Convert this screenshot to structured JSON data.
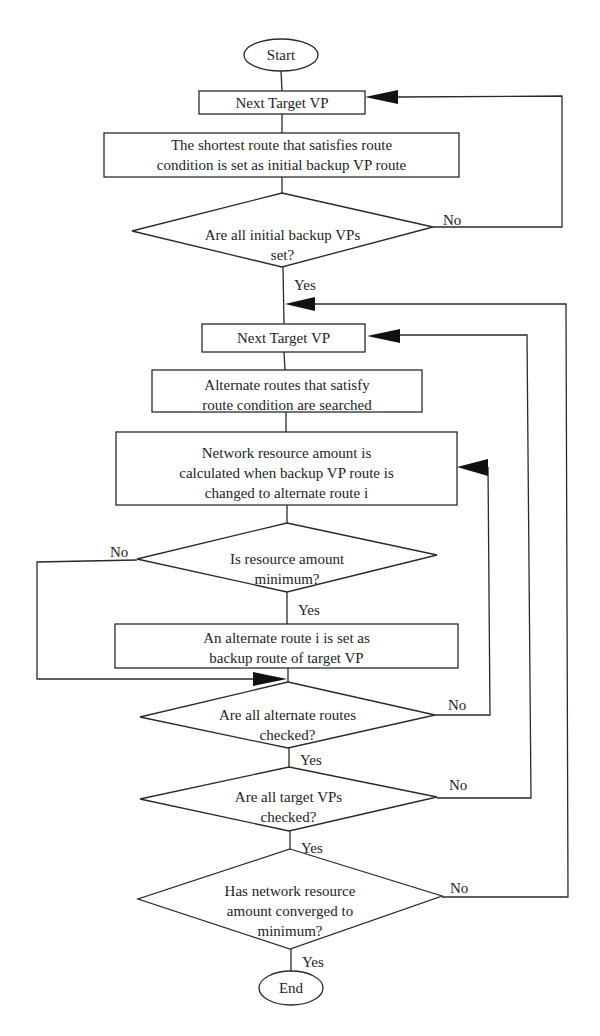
{
  "diagram": {
    "type": "flowchart",
    "nodes": [
      {
        "id": "start",
        "shape": "ellipse",
        "lines": [
          "Start"
        ]
      },
      {
        "id": "next-target-vp-1",
        "shape": "process",
        "lines": [
          "Next Target VP"
        ]
      },
      {
        "id": "set-initial-backup",
        "shape": "process",
        "lines": [
          "The shortest route that satisfies route",
          "condition is set as initial backup VP route"
        ]
      },
      {
        "id": "all-initial-set",
        "shape": "decision",
        "lines": [
          "Are all initial backup VPs",
          "set?"
        ]
      },
      {
        "id": "next-target-vp-2",
        "shape": "process",
        "lines": [
          "Next Target VP"
        ]
      },
      {
        "id": "search-alternate",
        "shape": "process",
        "lines": [
          "Alternate routes that satisfy",
          "route condition are searched"
        ]
      },
      {
        "id": "calc-resource",
        "shape": "process",
        "lines": [
          "Network resource amount is",
          "calculated when backup VP route is",
          "changed to alternate route i"
        ]
      },
      {
        "id": "is-minimum",
        "shape": "decision",
        "lines": [
          "Is resource amount",
          "minimum?"
        ]
      },
      {
        "id": "set-alternate",
        "shape": "process",
        "lines": [
          "An alternate route i is set as",
          "backup route of target VP"
        ]
      },
      {
        "id": "all-alternate-checked",
        "shape": "decision",
        "lines": [
          "Are all alternate routes",
          "checked?"
        ]
      },
      {
        "id": "all-target-checked",
        "shape": "decision",
        "lines": [
          "Are all target VPs",
          "checked?"
        ]
      },
      {
        "id": "converged",
        "shape": "decision",
        "lines": [
          "Has network resource",
          "amount converged to",
          "minimum?"
        ]
      },
      {
        "id": "end",
        "shape": "ellipse",
        "lines": [
          "End"
        ]
      }
    ],
    "edge_labels": {
      "d1_no": "No",
      "d1_yes": "Yes",
      "d2_no": "No",
      "d2_yes": "Yes",
      "d3_no": "No",
      "d3_yes": "Yes",
      "d4_no": "No",
      "d4_yes": "Yes",
      "d5_no": "No",
      "d5_yes": "Yes"
    },
    "edges": [
      {
        "from": "start",
        "to": "next-target-vp-1"
      },
      {
        "from": "next-target-vp-1",
        "to": "set-initial-backup"
      },
      {
        "from": "set-initial-backup",
        "to": "all-initial-set"
      },
      {
        "from": "all-initial-set",
        "to": "next-target-vp-1",
        "label": "No"
      },
      {
        "from": "all-initial-set",
        "to": "next-target-vp-2",
        "label": "Yes"
      },
      {
        "from": "next-target-vp-2",
        "to": "search-alternate"
      },
      {
        "from": "search-alternate",
        "to": "calc-resource"
      },
      {
        "from": "calc-resource",
        "to": "is-minimum"
      },
      {
        "from": "is-minimum",
        "to": "set-alternate",
        "label": "Yes"
      },
      {
        "from": "is-minimum",
        "to": "all-alternate-checked",
        "label": "No"
      },
      {
        "from": "set-alternate",
        "to": "all-alternate-checked"
      },
      {
        "from": "all-alternate-checked",
        "to": "calc-resource",
        "label": "No"
      },
      {
        "from": "all-alternate-checked",
        "to": "all-target-checked",
        "label": "Yes"
      },
      {
        "from": "all-target-checked",
        "to": "next-target-vp-2",
        "label": "No"
      },
      {
        "from": "all-target-checked",
        "to": "converged",
        "label": "Yes"
      },
      {
        "from": "converged",
        "to": "next-target-vp-2",
        "label": "No"
      },
      {
        "from": "converged",
        "to": "end",
        "label": "Yes"
      }
    ],
    "colors": {
      "stroke": "#2a2a2a",
      "background": "#ffffff"
    }
  }
}
